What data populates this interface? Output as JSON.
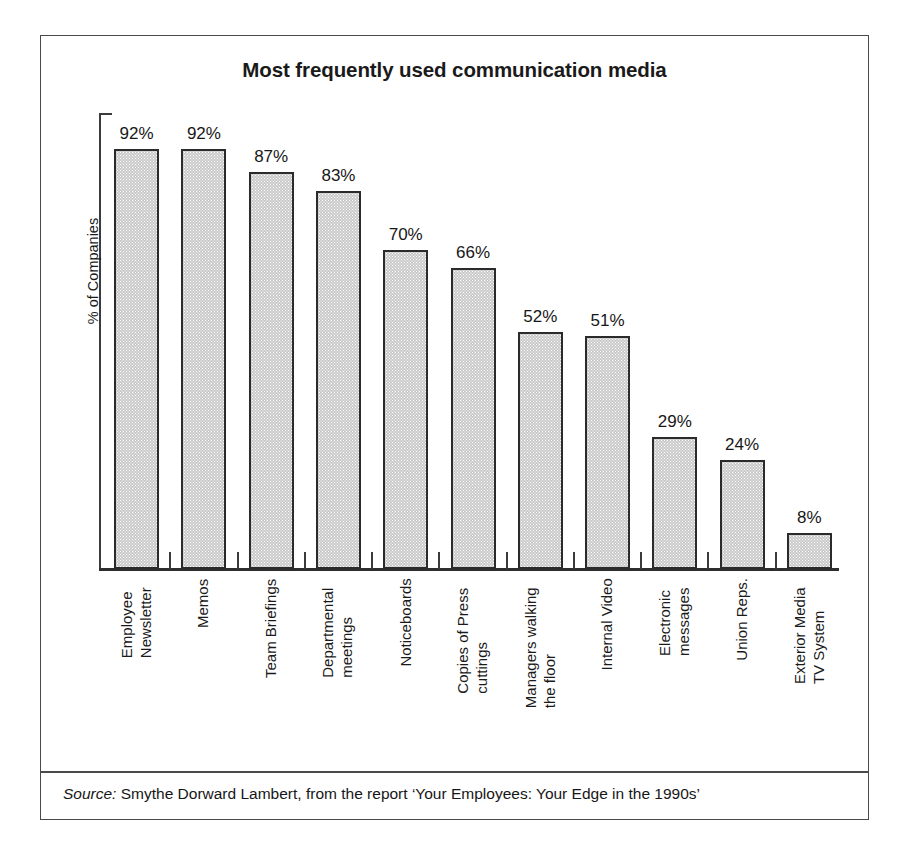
{
  "figure": {
    "title": "Most frequently used communication media",
    "y_axis_label": "% of Companies",
    "source_word": "Source:",
    "source_text": " Smythe Dorward Lambert, from the report ‘Your Employees: Your Edge in the 1990s’"
  },
  "chart_data": {
    "type": "bar",
    "title": "Most frequently used communication media",
    "xlabel": "",
    "ylabel": "% of Companies",
    "ylim": [
      0,
      100
    ],
    "grid": false,
    "legend": "none",
    "value_suffix": "%",
    "categories": [
      "Employee Newsletter",
      "Memos",
      "Team Briefings",
      "Departmental meetings",
      "Noticeboards",
      "Copies of Press cuttings",
      "Managers walking the floor",
      "Internal Video",
      "Electronic messages",
      "Union Reps.",
      "Exterior Media TV System"
    ],
    "category_lines": [
      [
        "Employee",
        "Newsletter"
      ],
      [
        "Memos",
        ""
      ],
      [
        "Team Briefings",
        ""
      ],
      [
        "Departmental",
        "meetings"
      ],
      [
        "Noticeboards",
        ""
      ],
      [
        "Copies of Press",
        "cuttings"
      ],
      [
        "Managers walking",
        "the floor"
      ],
      [
        "Internal Video",
        ""
      ],
      [
        "Electronic",
        "messages"
      ],
      [
        "Union Reps.",
        ""
      ],
      [
        "Exterior Media",
        "TV System"
      ]
    ],
    "values": [
      92,
      92,
      87,
      83,
      70,
      66,
      52,
      51,
      29,
      24,
      8
    ],
    "value_labels": [
      "92%",
      "92%",
      "87%",
      "83%",
      "70%",
      "66%",
      "52%",
      "51%",
      "29%",
      "24%",
      "8%"
    ],
    "bar_fill_color": "#c9c9c9",
    "bar_border_color": "#2b2b2b",
    "axis_color": "#3b3b3b"
  }
}
